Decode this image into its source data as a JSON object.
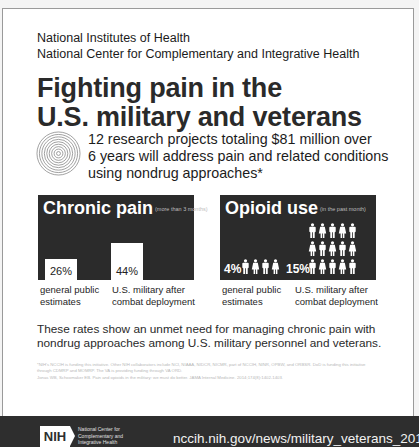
{
  "header": {
    "org_line1": "National Institutes of Health",
    "org_line2": "National Center for Complementary and Integrative Health"
  },
  "title": {
    "line1": "Fighting pain in the",
    "line2": "U.S. military and veterans"
  },
  "summary": {
    "icon": "concentric-circles-icon",
    "line1": "12 research projects totaling $81 million over",
    "line2": "6 years will address pain and related conditions",
    "line3": "using nondrug approaches*"
  },
  "chronic_pain": {
    "title": "Chronic pain",
    "subtitle": "(more than 3 months)",
    "bars": [
      {
        "value": "26%",
        "label_line1": "general public",
        "label_line2": "estimates"
      },
      {
        "value": "44%",
        "label_line1": "U.S. military after",
        "label_line2": "combat deployment"
      }
    ]
  },
  "opioid_use": {
    "title": "Opioid use",
    "subtitle": "(in the past month)",
    "groups": [
      {
        "value": "4%",
        "figures": 4,
        "label_line1": "general public",
        "label_line2": "estimates"
      },
      {
        "value": "15%",
        "figures": 15,
        "label_line1": "U.S. military after",
        "label_line2": "combat deployment"
      }
    ]
  },
  "rates_text": {
    "line1": "These rates show an unmet need for managing chronic pain with",
    "line2": "nondrug approaches among U.S. military personnel and veterans."
  },
  "footnotes": {
    "note": "*NIH's NCCIH is funding this initiative. Other NIH collaborators include NCI, NIAAA, NIDCR, NICMR, part of NCCIH, NINR, OPBW, and ORBSR. DoD is funding this initiative through CDMRP and MOMRP. The VA is providing funding through VA ORD.",
    "citation": "Jonas WB, Schoomaker EB. Pain and opioids in the military: we must do better. JAMA Internal Medicine. 2014;174(8):1402-1403."
  },
  "footer": {
    "logo_text": "NIH",
    "org_line1": "National Center for",
    "org_line2": "Complementary and",
    "org_line3": "Integrative Health",
    "url": "nccih.nih.gov/news/military_veterans_2017"
  },
  "colors": {
    "panel_bg": "#2b2b2b",
    "footer_bg": "#2e2e2e",
    "text": "#1e1e1e"
  },
  "chart_data": [
    {
      "type": "bar",
      "title": "Chronic pain (more than 3 months)",
      "categories": [
        "general public estimates",
        "U.S. military after combat deployment"
      ],
      "values": [
        26,
        44
      ],
      "unit": "%"
    },
    {
      "type": "pictograph",
      "title": "Opioid use (in the past month)",
      "categories": [
        "general public estimates",
        "U.S. military after combat deployment"
      ],
      "values": [
        4,
        15
      ],
      "unit": "%"
    }
  ]
}
